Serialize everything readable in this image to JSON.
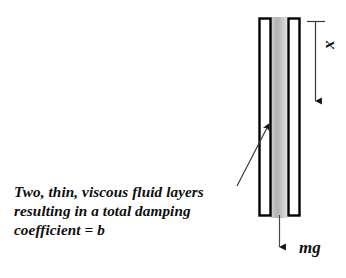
{
  "figure": {
    "background_color": "#ffffff",
    "stroke_color": "#000000",
    "fluid_fill_color": "#c8c8c8",
    "plate_fill_color": "#ffffff"
  },
  "caption": {
    "lines": [
      "Two, thin, viscous fluid layers",
      "resulting in a total damping",
      "coefficient = b"
    ],
    "line1": "Two, thin, viscous fluid layers",
    "line2": "resulting in a total damping",
    "line3": "coefficient = b"
  },
  "labels": {
    "displacement": "x",
    "weight": "mg"
  },
  "annotations": {
    "leader_line": "pointer from caption to fluid layer",
    "displacement_arrow": "downward arrow marking displacement x",
    "weight_arrow": "downward arrow marking force mg"
  }
}
